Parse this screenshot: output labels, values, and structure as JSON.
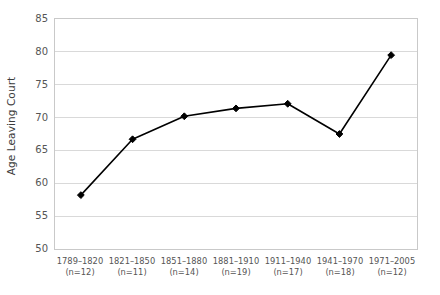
{
  "chart_data": {
    "type": "line",
    "title": "",
    "xlabel": "",
    "ylabel": "Age Leaving Court",
    "ylim": [
      50,
      85
    ],
    "yticks": [
      50,
      55,
      60,
      65,
      70,
      75,
      80,
      85
    ],
    "ytick_labels": [
      "50",
      "55",
      "60",
      "65",
      "70",
      "75",
      "80",
      "85"
    ],
    "grid": true,
    "legend": "none",
    "marker": "diamond",
    "line_color": "#000000",
    "marker_color": "#000000",
    "grid_color": "#d9d9d9",
    "axis_color": "#c9c9c9",
    "categories": [
      "1789–1820",
      "1821–1850",
      "1851–1880",
      "1881–1910",
      "1911–1940",
      "1941–1970",
      "1971–2005"
    ],
    "category_counts": [
      "(n=12)",
      "(n=11)",
      "(n=14)",
      "(n=19)",
      "(n=17)",
      "(n=18)",
      "(n=12)"
    ],
    "xtick_labels": [
      "1789–1820\n(n=12)",
      "1821–1850\n(n=11)",
      "1851–1880\n(n=14)",
      "1881–1910\n(n=19)",
      "1911–1940\n(n=17)",
      "1941–1970\n(n=18)",
      "1971–2005\n(n=12)"
    ],
    "values": [
      58.2,
      66.7,
      70.2,
      71.4,
      72.1,
      67.5,
      79.5
    ],
    "series": [
      {
        "name": "Age Leaving Court",
        "values": [
          58.2,
          66.7,
          70.2,
          71.4,
          72.1,
          67.5,
          79.5
        ]
      }
    ]
  }
}
